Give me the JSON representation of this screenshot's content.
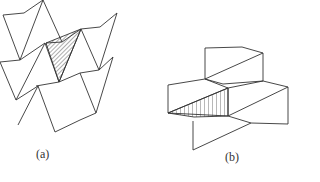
{
  "figure": {
    "panels": [
      {
        "id": "a",
        "label": "(a)",
        "description": "Zigzag folded sheet structure with one hatched (diagonal) triangular facet"
      },
      {
        "id": "b",
        "label": "(b)",
        "description": "Stepped folded planar facets with one vertically hatched trapezoidal facet"
      }
    ],
    "colors": {
      "line": "#333333",
      "background": "#ffffff"
    }
  }
}
